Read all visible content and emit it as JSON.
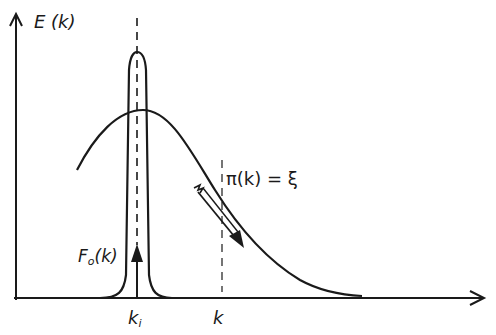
{
  "diagram": {
    "y_axis_label": "E (k)",
    "x_axis_label": "",
    "curves": [
      {
        "name": "F0(k)",
        "label_main": "F",
        "label_sub": "o",
        "label_tail": "(k)",
        "description": "narrow peaked distribution centered at k_i"
      },
      {
        "name": "pi(k)",
        "label": "π(k) = ξ",
        "description": "broad bell-shaped curve decaying to the right"
      }
    ],
    "markers": [
      {
        "name": "k_i",
        "label_main": "k",
        "label_sub": "i",
        "style": "dashed vertical line"
      },
      {
        "name": "k",
        "label": "k",
        "style": "dashed vertical line"
      }
    ],
    "annotations": [
      {
        "type": "arrow",
        "description": "upward arrow at k_i inside narrow peak"
      },
      {
        "type": "arrow",
        "description": "diagonal arrow down-right along broad curve"
      }
    ],
    "stroke_color": "#1a1a1a",
    "background": "#ffffff"
  }
}
